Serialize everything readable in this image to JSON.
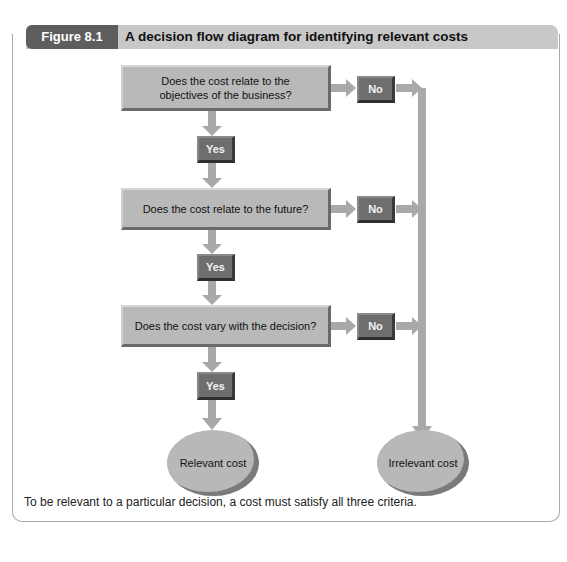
{
  "figure": {
    "label": "Figure 8.1",
    "title": "A decision flow diagram for identifying relevant costs",
    "caption": "To be relevant to a particular decision, a cost must satisfy all three criteria."
  },
  "questions": [
    {
      "line1": "Does the cost relate to the",
      "line2": "objectives of the business?"
    },
    {
      "line1": "Does the cost relate to the future?",
      "line2": ""
    },
    {
      "line1": "Does the cost vary with the decision?",
      "line2": ""
    }
  ],
  "answers": {
    "yes": "Yes",
    "no": "No"
  },
  "outcomes": {
    "relevant": "Relevant cost",
    "irrelevant": "Irrelevant cost"
  },
  "colors": {
    "box": "#b9b9b9",
    "pill": "#6e6e6e",
    "arrow": "#a9a9a9",
    "header": "#c8c8c8",
    "tab": "#5e5e5e"
  }
}
